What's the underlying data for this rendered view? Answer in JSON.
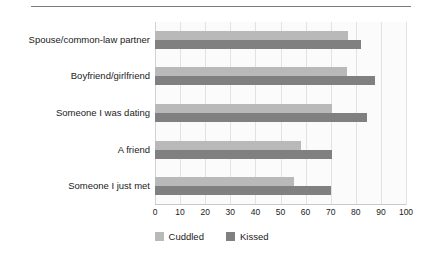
{
  "figure": {
    "title": "",
    "width": 423,
    "height": 256
  },
  "chart_data": {
    "type": "bar",
    "orientation": "horizontal",
    "title": "",
    "xlabel": "",
    "ylabel": "",
    "xlim": [
      0,
      100
    ],
    "xticks": [
      0,
      10,
      20,
      30,
      40,
      50,
      60,
      70,
      80,
      90,
      100
    ],
    "grid": true,
    "legend_position": "bottom-center",
    "categories": [
      "Spouse/common-law partner",
      "Boyfriend/girlfriend",
      "Someone I was dating",
      "A friend",
      "Someone I just met"
    ],
    "series": [
      {
        "name": "Cuddled",
        "color": "#b9b9b9",
        "values": [
          77,
          76.5,
          70.5,
          58,
          55.5
        ]
      },
      {
        "name": "Kissed",
        "color": "#808080",
        "values": [
          82,
          87.5,
          84.5,
          70.5,
          70
        ]
      }
    ]
  },
  "colors": {
    "cuddled": "#b9b9b9",
    "kissed": "#808080",
    "gridline": "#e2e2e2",
    "rule": "#7b7b7b",
    "text": "#1b1b1b"
  }
}
